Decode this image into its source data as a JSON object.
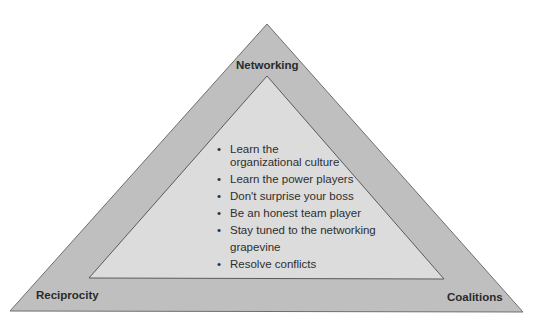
{
  "diagram": {
    "colors": {
      "outer_fill": "#bfbfbf",
      "inner_fill": "#dcdcdc",
      "stroke": "#6e6e6e",
      "text": "#2e2e2e"
    },
    "outer_triangle": {
      "apex": [
        267,
        24
      ],
      "left": [
        10,
        311
      ],
      "right": [
        523,
        312
      ]
    },
    "inner_triangle": {
      "apex": [
        267,
        76
      ],
      "left": [
        89,
        278
      ],
      "right": [
        444,
        279
      ]
    },
    "corners": {
      "top": "Networking",
      "bottom_left": "Reciprocity",
      "bottom_right": "Coalitions"
    },
    "bullet_symbol": "•",
    "bullets": [
      {
        "lines": [
          "Learn the",
          "organizational culture"
        ]
      },
      {
        "lines": [
          "Learn the power players"
        ]
      },
      {
        "lines": [
          "Don't surprise your boss"
        ]
      },
      {
        "lines": [
          "Be an honest team player"
        ]
      },
      {
        "lines": [
          "Stay tuned to the networking",
          "grapevine"
        ]
      },
      {
        "lines": [
          "Resolve conflicts"
        ]
      }
    ]
  }
}
